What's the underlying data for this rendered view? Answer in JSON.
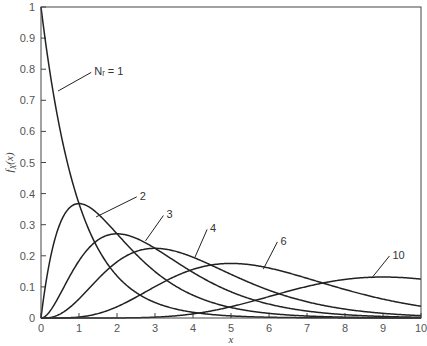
{
  "chart_data": {
    "type": "line",
    "title": "",
    "xlabel": "x",
    "ylabel": "f_X(x)",
    "xlim": [
      0,
      10
    ],
    "ylim": [
      0,
      1
    ],
    "grid": false,
    "legend": "inline labels with leader arrows",
    "x_ticks": [
      0,
      1,
      2,
      3,
      4,
      5,
      6,
      7,
      8,
      9,
      10
    ],
    "y_ticks": [
      0,
      0.1,
      0.2,
      0.3,
      0.4,
      0.5,
      0.6,
      0.7,
      0.8,
      0.9,
      1
    ],
    "y_tick_labels": [
      "0",
      "0.1",
      "0.2",
      "0.3",
      "0.4",
      "0.5",
      "0.6",
      "0.7",
      "0.8",
      "0.9",
      "1"
    ],
    "x_tick_labels": [
      "0",
      "1",
      "2",
      "3",
      "4",
      "5",
      "6",
      "7",
      "8",
      "9",
      "10"
    ],
    "series": [
      {
        "name": "N_r = 1",
        "label": "Nᵣ = 1",
        "N": 1,
        "peak": {
          "x": 0,
          "y": 1.0
        }
      },
      {
        "name": "2",
        "label": "2",
        "N": 2,
        "peak": {
          "x": 1,
          "y": 0.368
        }
      },
      {
        "name": "3",
        "label": "3",
        "N": 3,
        "peak": {
          "x": 2,
          "y": 0.271
        }
      },
      {
        "name": "4",
        "label": "4",
        "N": 4,
        "peak": {
          "x": 3,
          "y": 0.224
        }
      },
      {
        "name": "6",
        "label": "6",
        "N": 6,
        "peak": {
          "x": 5,
          "y": 0.175
        }
      },
      {
        "name": "10",
        "label": "10",
        "N": 10,
        "peak": {
          "x": 9,
          "y": 0.132
        }
      }
    ],
    "annotations": [
      {
        "text": "Nᵣ = 1",
        "text_x": 1.4,
        "text_y": 0.78,
        "arrow_to_x": 0.45,
        "arrow_to_y": 0.73
      },
      {
        "text": "2",
        "text_x": 2.6,
        "text_y": 0.38,
        "arrow_to_x": 1.45,
        "arrow_to_y": 0.325
      },
      {
        "text": "3",
        "text_x": 3.3,
        "text_y": 0.32,
        "arrow_to_x": 2.75,
        "arrow_to_y": 0.248
      },
      {
        "text": "4",
        "text_x": 4.45,
        "text_y": 0.275,
        "arrow_to_x": 4.05,
        "arrow_to_y": 0.195
      },
      {
        "text": "6",
        "text_x": 6.3,
        "text_y": 0.235,
        "arrow_to_x": 5.85,
        "arrow_to_y": 0.157
      },
      {
        "text": "10",
        "text_x": 9.25,
        "text_y": 0.19,
        "arrow_to_x": 8.7,
        "arrow_to_y": 0.128
      }
    ]
  },
  "layout": {
    "plot_left": 41,
    "plot_right": 421,
    "plot_top": 7,
    "plot_bottom": 318
  }
}
